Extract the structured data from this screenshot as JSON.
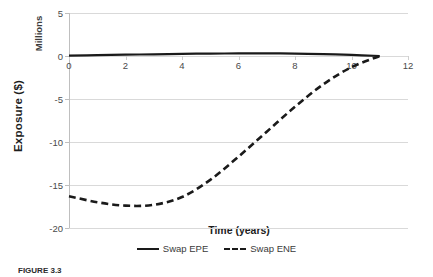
{
  "chart_data": {
    "type": "line",
    "title": "",
    "xlabel": "Time (years)",
    "ylabel": "Exposure ($)",
    "y_units_label": "Millions",
    "xlim": [
      0,
      12
    ],
    "ylim": [
      -20,
      5
    ],
    "xticks": [
      0,
      2,
      4,
      6,
      8,
      10,
      12
    ],
    "yticks": [
      5,
      0,
      -5,
      -10,
      -15,
      -20
    ],
    "xticklabels": [
      "0",
      "2",
      "4",
      "6",
      "8",
      "10",
      "12"
    ],
    "yticklabels": [
      "5",
      "0",
      "-5",
      "-10",
      "-15",
      "-20"
    ],
    "grid": "horizontal",
    "legend_position": "bottom-center",
    "series": [
      {
        "name": "Swap EPE",
        "style": "solid",
        "color": "#1a1a1a",
        "x": [
          0,
          1,
          2,
          3,
          4,
          5,
          6,
          7,
          8,
          9,
          10,
          11
        ],
        "values": [
          0.05,
          0.1,
          0.15,
          0.2,
          0.25,
          0.28,
          0.3,
          0.3,
          0.28,
          0.22,
          0.12,
          0.0
        ]
      },
      {
        "name": "Swap ENE",
        "style": "dashed",
        "color": "#1a1a1a",
        "x": [
          0,
          1,
          2,
          3,
          4,
          5,
          6,
          7,
          8,
          9,
          10,
          11
        ],
        "values": [
          -16.3,
          -17.0,
          -17.4,
          -17.3,
          -16.4,
          -14.4,
          -11.7,
          -8.8,
          -5.9,
          -3.3,
          -1.3,
          0.0
        ]
      }
    ]
  },
  "legend": {
    "items": [
      {
        "label": "Swap EPE",
        "style": "solid"
      },
      {
        "label": "Swap ENE",
        "style": "dashed"
      }
    ]
  },
  "caption": {
    "figure_number": "FIGURE 3.3",
    "text": ""
  }
}
